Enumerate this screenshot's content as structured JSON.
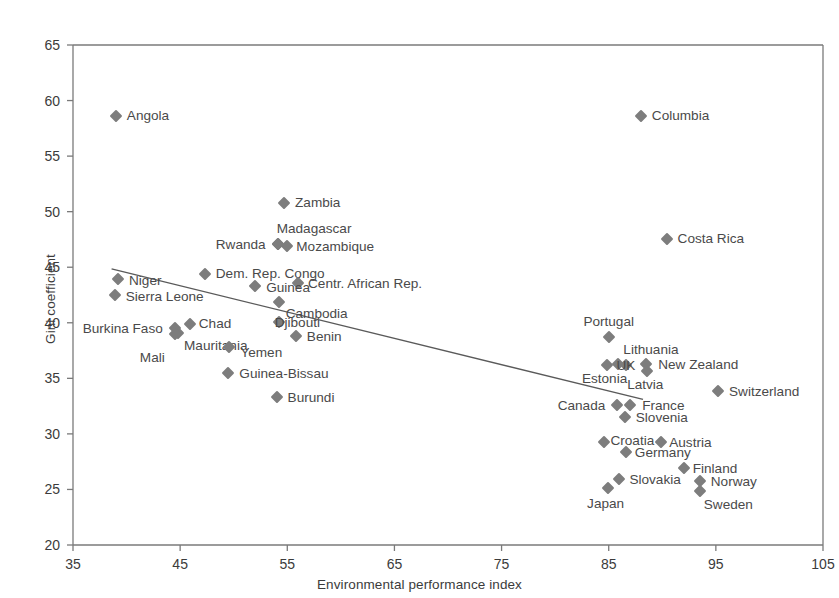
{
  "chart_data": {
    "type": "scatter",
    "title": "",
    "xlabel": "Environmental performance index",
    "ylabel": "Gini coefficient",
    "xlim": [
      35,
      105
    ],
    "ylim": [
      20,
      65
    ],
    "xticks": [
      35,
      45,
      55,
      65,
      75,
      85,
      95,
      105
    ],
    "yticks": [
      20,
      25,
      30,
      35,
      40,
      45,
      50,
      55,
      60,
      65
    ],
    "grid": false,
    "legend": "none",
    "marker_color": "#7d7d7d",
    "marker_shape": "diamond",
    "trendline": {
      "label": "linear trend",
      "x": [
        38.6,
        88.2
      ],
      "y": [
        44.85,
        33.1
      ],
      "color": "#5a5a5a"
    },
    "points": [
      {
        "name": "Angola",
        "x": 39.0,
        "y": 58.6,
        "label_dx": 11,
        "label_dy": 0,
        "anchor": "left"
      },
      {
        "name": "Columbia",
        "x": 88.0,
        "y": 58.6,
        "label_dx": 11,
        "label_dy": 0,
        "anchor": "left"
      },
      {
        "name": "Zambia",
        "x": 54.7,
        "y": 50.8,
        "label_dx": 11,
        "label_dy": 0,
        "anchor": "left"
      },
      {
        "name": "Costa Rica",
        "x": 90.4,
        "y": 47.5,
        "label_dx": 11,
        "label_dy": 0,
        "anchor": "left"
      },
      {
        "name": "Madagascar",
        "x": 54.1,
        "y": 47.1,
        "label_dx": -1,
        "label_dy": -15,
        "anchor": "left"
      },
      {
        "name": "Mozambique",
        "x": 55.0,
        "y": 46.9,
        "label_dx": 9,
        "label_dy": 1,
        "anchor": "left"
      },
      {
        "name": "Rwanda",
        "x": 54.1,
        "y": 47.1,
        "label_dx": -12,
        "label_dy": 1,
        "anchor": "right"
      },
      {
        "name": "Dem. Rep. Congo",
        "x": 47.3,
        "y": 44.4,
        "label_dx": 11,
        "label_dy": 0,
        "anchor": "left"
      },
      {
        "name": "Niger",
        "x": 39.2,
        "y": 43.9,
        "label_dx": 11,
        "label_dy": 2,
        "anchor": "left"
      },
      {
        "name": "Centr. African Rep.",
        "x": 56.0,
        "y": 43.6,
        "label_dx": 10,
        "label_dy": 1,
        "anchor": "left"
      },
      {
        "name": "Guinea",
        "x": 52.0,
        "y": 43.3,
        "label_dx": 11,
        "label_dy": 2,
        "anchor": "left"
      },
      {
        "name": "Sierra Leone",
        "x": 38.9,
        "y": 42.5,
        "label_dx": 11,
        "label_dy": 2,
        "anchor": "left"
      },
      {
        "name": "Cambodia",
        "x": 54.2,
        "y": 41.9,
        "label_dx": 7,
        "label_dy": 12,
        "anchor": "left"
      },
      {
        "name": "Djibouti",
        "x": 54.2,
        "y": 40.1,
        "label_dx": -4,
        "label_dy": 1,
        "anchor": "left"
      },
      {
        "name": "Chad",
        "x": 45.9,
        "y": 39.9,
        "label_dx": 9,
        "label_dy": 0,
        "anchor": "left"
      },
      {
        "name": "Burkina Faso",
        "x": 44.5,
        "y": 39.5,
        "label_dx": -12,
        "label_dy": 1,
        "anchor": "right"
      },
      {
        "name": "Mauritania",
        "x": 44.8,
        "y": 39.1,
        "label_dx": 6,
        "label_dy": 13,
        "anchor": "left"
      },
      {
        "name": "Benin",
        "x": 55.8,
        "y": 38.8,
        "label_dx": 11,
        "label_dy": 1,
        "anchor": "left"
      },
      {
        "name": "Mali",
        "x": 44.5,
        "y": 39.0,
        "label_dx": -10,
        "label_dy": 24,
        "anchor": "right"
      },
      {
        "name": "Yemen",
        "x": 49.6,
        "y": 37.8,
        "label_dx": 11,
        "label_dy": 6,
        "anchor": "left"
      },
      {
        "name": "Portugal",
        "x": 85.0,
        "y": 38.7,
        "label_dx": 0,
        "label_dy": -15,
        "anchor": "center"
      },
      {
        "name": "Lithuania",
        "x": 85.9,
        "y": 36.3,
        "label_dx": 5,
        "label_dy": -14,
        "anchor": "left"
      },
      {
        "name": "Estonia",
        "x": 84.8,
        "y": 36.2,
        "label_dx": -2,
        "label_dy": 14,
        "anchor": "center"
      },
      {
        "name": "UK",
        "x": 86.6,
        "y": 36.2,
        "label_dx": 0,
        "label_dy": 1,
        "anchor": "center"
      },
      {
        "name": "New Zealand",
        "x": 88.5,
        "y": 36.3,
        "label_dx": 12,
        "label_dy": 1,
        "anchor": "left"
      },
      {
        "name": "Latvia",
        "x": 88.6,
        "y": 35.7,
        "label_dx": -2,
        "label_dy": 14,
        "anchor": "center"
      },
      {
        "name": "Guinea-Bissau",
        "x": 49.5,
        "y": 35.5,
        "label_dx": 11,
        "label_dy": 1,
        "anchor": "left"
      },
      {
        "name": "Switzerland",
        "x": 95.2,
        "y": 33.9,
        "label_dx": 11,
        "label_dy": 1,
        "anchor": "left"
      },
      {
        "name": "Burundi",
        "x": 54.0,
        "y": 33.3,
        "label_dx": 11,
        "label_dy": 1,
        "anchor": "left"
      },
      {
        "name": "Canada",
        "x": 85.8,
        "y": 32.6,
        "label_dx": -12,
        "label_dy": 1,
        "anchor": "right"
      },
      {
        "name": "France",
        "x": 87.0,
        "y": 32.6,
        "label_dx": 12,
        "label_dy": 1,
        "anchor": "left"
      },
      {
        "name": "Slovenia",
        "x": 86.5,
        "y": 31.5,
        "label_dx": 11,
        "label_dy": 1,
        "anchor": "left"
      },
      {
        "name": "Croatia",
        "x": 84.6,
        "y": 29.3,
        "label_dx": 6,
        "label_dy": -1,
        "anchor": "left"
      },
      {
        "name": "Austria",
        "x": 89.9,
        "y": 29.3,
        "label_dx": 8,
        "label_dy": 1,
        "anchor": "left"
      },
      {
        "name": "Germany",
        "x": 86.6,
        "y": 28.4,
        "label_dx": 9,
        "label_dy": 1,
        "anchor": "left"
      },
      {
        "name": "Finland",
        "x": 92.0,
        "y": 26.9,
        "label_dx": 9,
        "label_dy": 1,
        "anchor": "left"
      },
      {
        "name": "Slovakia",
        "x": 86.0,
        "y": 25.9,
        "label_dx": 10,
        "label_dy": 1,
        "anchor": "left"
      },
      {
        "name": "Norway",
        "x": 93.5,
        "y": 25.8,
        "label_dx": 11,
        "label_dy": 1,
        "anchor": "left"
      },
      {
        "name": "Sweden",
        "x": 93.5,
        "y": 24.9,
        "label_dx": 4,
        "label_dy": 14,
        "anchor": "left"
      },
      {
        "name": "Japan",
        "x": 84.9,
        "y": 25.1,
        "label_dx": -2,
        "label_dy": 16,
        "anchor": "center"
      }
    ]
  }
}
